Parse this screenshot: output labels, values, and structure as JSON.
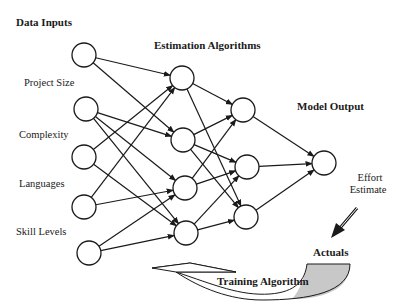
{
  "diagram": {
    "headers": {
      "inputs": "Data Inputs",
      "hidden": "Estimation Algorithms",
      "output": "Model Output"
    },
    "input_labels": [
      "Project Size",
      "Complexity",
      "Languages",
      "Skill Levels"
    ],
    "output_label_line1": "Effort",
    "output_label_line2": "Estimate",
    "actuals_label": "Actuals",
    "training_label": "Training Algorithm",
    "colors": {
      "stroke": "#1a1a1a",
      "node_fill": "#ffffff",
      "shade": "#c8c8c8"
    },
    "layers": {
      "input": [
        [
          84,
          55
        ],
        [
          86,
          109
        ],
        [
          84,
          157
        ],
        [
          84,
          207
        ],
        [
          89,
          253
        ]
      ],
      "hidden1": [
        [
          182,
          78
        ],
        [
          183,
          140
        ],
        [
          185,
          188
        ],
        [
          186,
          233
        ]
      ],
      "hidden2": [
        [
          243,
          110
        ],
        [
          247,
          167
        ],
        [
          246,
          217
        ]
      ],
      "output": [
        [
          324,
          163
        ]
      ]
    },
    "edges": {
      "input_to_hidden1": [
        [
          0,
          0
        ],
        [
          0,
          1
        ],
        [
          1,
          1
        ],
        [
          1,
          2
        ],
        [
          1,
          3
        ],
        [
          2,
          0
        ],
        [
          2,
          3
        ],
        [
          3,
          0
        ],
        [
          3,
          2
        ],
        [
          4,
          2
        ],
        [
          4,
          3
        ]
      ],
      "hidden1_to_hidden2": [
        [
          0,
          0
        ],
        [
          0,
          2
        ],
        [
          1,
          0
        ],
        [
          1,
          1
        ],
        [
          1,
          2
        ],
        [
          2,
          0
        ],
        [
          2,
          1
        ],
        [
          3,
          1
        ],
        [
          3,
          2
        ]
      ],
      "hidden2_to_output": [
        [
          0,
          0
        ],
        [
          1,
          0
        ],
        [
          2,
          0
        ]
      ]
    }
  }
}
